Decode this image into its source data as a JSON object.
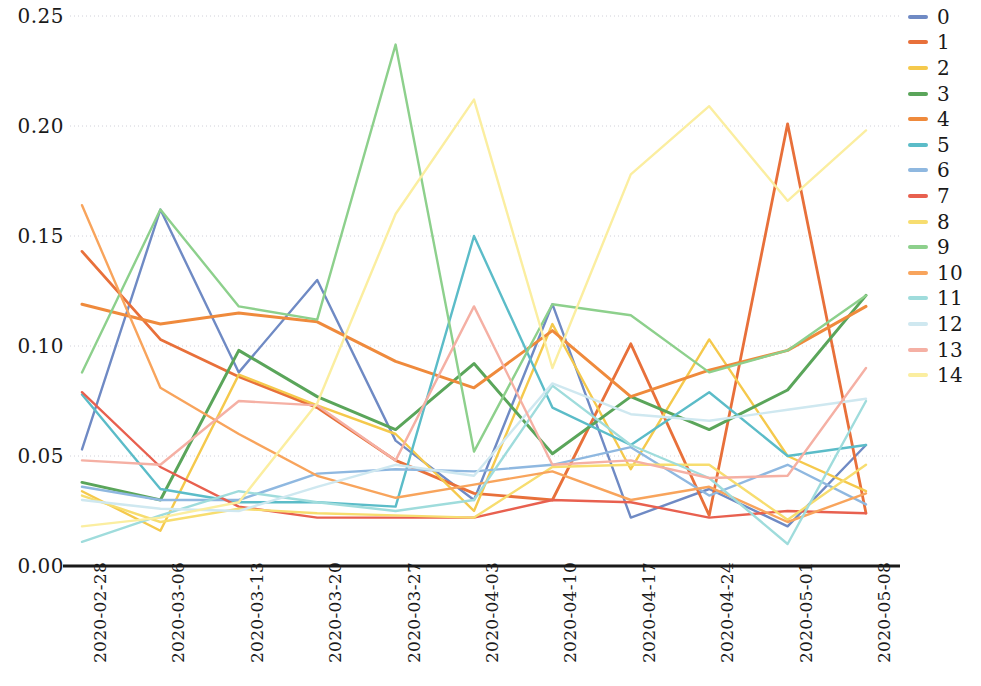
{
  "chart_data": {
    "type": "line",
    "title": "",
    "xlabel": "",
    "ylabel": "",
    "grid": true,
    "legend_position": "right",
    "ylim": [
      0.0,
      0.255
    ],
    "yticks": [
      "0.00",
      "0.05",
      "0.10",
      "0.15",
      "0.20",
      "0.25"
    ],
    "ytick_values": [
      0.0,
      0.05,
      0.1,
      0.15,
      0.2,
      0.25
    ],
    "categories": [
      "2020-02-28",
      "2020-03-06",
      "2020-03-13",
      "2020-03-20",
      "2020-03-27",
      "2020-04-03",
      "2020-04-10",
      "2020-04-17",
      "2020-04-24",
      "2020-05-01",
      "2020-05-08"
    ],
    "series": [
      {
        "name": "0",
        "color": "#6f8ac4",
        "width": 2.4,
        "values": [
          0.053,
          0.162,
          0.088,
          0.13,
          0.057,
          0.03,
          0.119,
          0.022,
          0.035,
          0.018,
          0.055
        ]
      },
      {
        "name": "1",
        "color": "#e8703a",
        "width": 2.8,
        "values": [
          0.143,
          0.103,
          0.086,
          0.072,
          0.048,
          0.033,
          0.03,
          0.101,
          0.023,
          0.201,
          0.024
        ]
      },
      {
        "name": "2",
        "color": "#f5c94c",
        "width": 2.4,
        "values": [
          0.034,
          0.016,
          0.087,
          0.073,
          0.06,
          0.025,
          0.11,
          0.044,
          0.103,
          0.05,
          0.034
        ]
      },
      {
        "name": "3",
        "color": "#5aa55a",
        "width": 3.0,
        "values": [
          0.038,
          0.03,
          0.098,
          0.077,
          0.062,
          0.092,
          0.051,
          0.077,
          0.062,
          0.08,
          0.123
        ]
      },
      {
        "name": "4",
        "color": "#ef8a3c",
        "width": 3.0,
        "values": [
          0.119,
          0.11,
          0.115,
          0.111,
          0.093,
          0.081,
          0.107,
          0.077,
          0.089,
          0.098,
          0.118
        ]
      },
      {
        "name": "5",
        "color": "#5bbcc8",
        "width": 2.4,
        "values": [
          0.078,
          0.035,
          0.029,
          0.029,
          0.027,
          0.15,
          0.072,
          0.055,
          0.079,
          0.05,
          0.055
        ]
      },
      {
        "name": "6",
        "color": "#8fb8e0",
        "width": 2.4,
        "values": [
          0.036,
          0.03,
          0.03,
          0.042,
          0.044,
          0.043,
          0.046,
          0.054,
          0.032,
          0.046,
          0.028
        ]
      },
      {
        "name": "7",
        "color": "#e8604f",
        "width": 2.4,
        "values": [
          0.079,
          0.045,
          0.027,
          0.022,
          0.022,
          0.022,
          0.03,
          0.029,
          0.022,
          0.025,
          0.024
        ]
      },
      {
        "name": "8",
        "color": "#f7dd6f",
        "width": 2.4,
        "values": [
          0.032,
          0.02,
          0.026,
          0.024,
          0.023,
          0.022,
          0.045,
          0.046,
          0.046,
          0.021,
          0.046
        ]
      },
      {
        "name": "9",
        "color": "#8dd08c",
        "width": 2.4,
        "values": [
          0.088,
          0.162,
          0.118,
          0.112,
          0.237,
          0.052,
          0.119,
          0.114,
          0.088,
          0.098,
          0.123
        ]
      },
      {
        "name": "10",
        "color": "#f8a45c",
        "width": 2.4,
        "values": [
          0.164,
          0.081,
          0.06,
          0.041,
          0.031,
          0.037,
          0.043,
          0.03,
          0.036,
          0.02,
          0.033
        ]
      },
      {
        "name": "11",
        "color": "#9fdcdc",
        "width": 2.4,
        "values": [
          0.011,
          0.023,
          0.034,
          0.029,
          0.025,
          0.03,
          0.082,
          0.055,
          0.04,
          0.01,
          0.075
        ]
      },
      {
        "name": "12",
        "color": "#cfe8f0",
        "width": 2.4,
        "values": [
          0.03,
          0.026,
          0.025,
          0.036,
          0.046,
          0.041,
          0.083,
          0.069,
          0.066,
          0.071,
          0.076
        ]
      },
      {
        "name": "13",
        "color": "#f5b0a4",
        "width": 2.4,
        "values": [
          0.048,
          0.046,
          0.075,
          0.073,
          0.048,
          0.118,
          0.046,
          0.048,
          0.04,
          0.041,
          0.09
        ]
      },
      {
        "name": "14",
        "color": "#fbeea0",
        "width": 2.4,
        "values": [
          0.018,
          0.022,
          0.029,
          0.074,
          0.16,
          0.212,
          0.09,
          0.178,
          0.209,
          0.166,
          0.198
        ]
      }
    ]
  },
  "legend": {
    "entries": [
      {
        "label": "0",
        "color": "#6f8ac4"
      },
      {
        "label": "1",
        "color": "#e8703a"
      },
      {
        "label": "2",
        "color": "#f5c94c"
      },
      {
        "label": "3",
        "color": "#5aa55a"
      },
      {
        "label": "4",
        "color": "#ef8a3c"
      },
      {
        "label": "5",
        "color": "#5bbcc8"
      },
      {
        "label": "6",
        "color": "#8fb8e0"
      },
      {
        "label": "7",
        "color": "#e8604f"
      },
      {
        "label": "8",
        "color": "#f7dd6f"
      },
      {
        "label": "9",
        "color": "#8dd08c"
      },
      {
        "label": "10",
        "color": "#f8a45c"
      },
      {
        "label": "11",
        "color": "#9fdcdc"
      },
      {
        "label": "12",
        "color": "#cfe8f0"
      },
      {
        "label": "13",
        "color": "#f5b0a4"
      },
      {
        "label": "14",
        "color": "#fbeea0"
      }
    ]
  },
  "axes": {
    "axis_color": "#1a1a1a",
    "grid_color": "#c8c8d2"
  }
}
